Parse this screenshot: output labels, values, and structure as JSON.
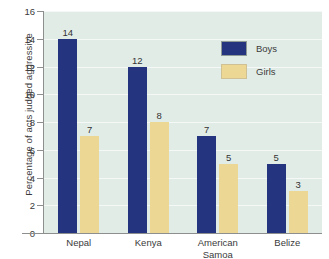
{
  "chart_data": {
    "type": "bar",
    "title": "",
    "xlabel": "",
    "ylabel": "Percentage of acts judged aggressive",
    "categories": [
      "Nepal",
      "Kenya",
      "American\nSamoa",
      "Belize"
    ],
    "series": [
      {
        "name": "Boys",
        "color": "#24347f",
        "values": [
          14,
          12,
          7,
          5
        ]
      },
      {
        "name": "Girls",
        "color": "#edd794",
        "values": [
          7,
          8,
          5,
          3
        ]
      }
    ],
    "ylim": [
      0,
      16
    ],
    "yticks": [
      0,
      2,
      4,
      6,
      8,
      10,
      12,
      14,
      16
    ],
    "ytick_labels": [
      "0",
      "2",
      "4",
      "6",
      "8",
      "10",
      "12",
      "14",
      "16"
    ],
    "grid": "horizontal",
    "legend_position": "upper-right",
    "plot_background": "#e2ece7",
    "axis_color": "#8d8f8e",
    "data_labels": [
      {
        "category": "Nepal",
        "series": "Boys",
        "value": "14"
      },
      {
        "category": "Nepal",
        "series": "Girls",
        "value": "7"
      },
      {
        "category": "Kenya",
        "series": "Boys",
        "value": "12"
      },
      {
        "category": "Kenya",
        "series": "Girls",
        "value": "8"
      },
      {
        "category": "American Samoa",
        "series": "Boys",
        "value": "7"
      },
      {
        "category": "American Samoa",
        "series": "Girls",
        "value": "5"
      },
      {
        "category": "Belize",
        "series": "Boys",
        "value": "5"
      },
      {
        "category": "Belize",
        "series": "Girls",
        "value": "3"
      }
    ]
  }
}
